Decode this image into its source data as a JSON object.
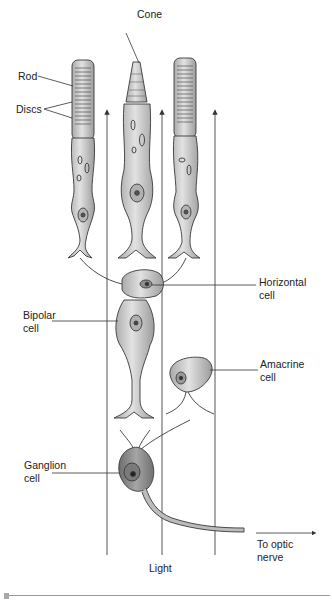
{
  "figure": {
    "labels": {
      "cone": "Cone",
      "rod": "Rod",
      "discs": "Discs",
      "horizontal_line1": "Horizontal",
      "horizontal_line2": "cell",
      "bipolar_line1": "Bipolar",
      "bipolar_line2": "cell",
      "amacrine_line1": "Amacrine",
      "amacrine_line2": "cell",
      "ganglion_line1": "Ganglion",
      "ganglion_line2": "cell",
      "optic_line1": "To optic",
      "optic_line2": "nerve",
      "light": "Light"
    },
    "colors": {
      "cell_fill": "#cfcfcf",
      "cell_stroke": "#3a3a3a",
      "ganglion_fill": "#8f8f8f",
      "line": "#333333",
      "separator": "#9a9a9a"
    }
  }
}
